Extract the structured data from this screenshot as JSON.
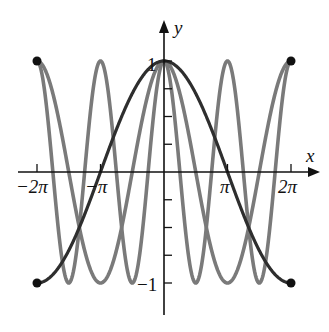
{
  "chart_data": {
    "type": "line",
    "title": "",
    "xlabel": "x",
    "ylabel": "y",
    "xlim": [
      -6.2832,
      6.2832
    ],
    "ylim": [
      -1,
      1
    ],
    "grid": false,
    "legend": null,
    "x_ticks": [
      {
        "value": -6.2832,
        "label": "−2π"
      },
      {
        "value": -3.1416,
        "label": "−π"
      },
      {
        "value": 3.1416,
        "label": "π"
      },
      {
        "value": 6.2832,
        "label": "2π"
      }
    ],
    "y_ticks": [
      {
        "value": 1,
        "label": "1"
      },
      {
        "value": 0.75,
        "label": ""
      },
      {
        "value": 0.5,
        "label": ""
      },
      {
        "value": 0.25,
        "label": ""
      },
      {
        "value": -0.25,
        "label": ""
      },
      {
        "value": -0.5,
        "label": ""
      },
      {
        "value": -0.75,
        "label": ""
      },
      {
        "value": -1,
        "label": "−1"
      }
    ],
    "series": [
      {
        "name": "cos(x/2)",
        "k": 0.5,
        "color": "#2e2e2e",
        "width": 3.2
      },
      {
        "name": "cos(x)",
        "k": 1,
        "color": "#7a7a7a",
        "width": 3.6
      },
      {
        "name": "cos(2x)",
        "k": 2,
        "color": "#7a7a7a",
        "width": 3.6
      }
    ],
    "endpoints": [
      {
        "x": -6.2832,
        "y": 1
      },
      {
        "x": 6.2832,
        "y": 1
      },
      {
        "x": -6.2832,
        "y": -1
      },
      {
        "x": 6.2832,
        "y": -1
      }
    ]
  },
  "labels": {
    "x_axis": "x",
    "y_axis": "y",
    "y_one": "1",
    "y_neg_one": "−1",
    "neg_two_pi": "−2π",
    "neg_pi": "−π",
    "pi": "π",
    "two_pi": "2π"
  }
}
